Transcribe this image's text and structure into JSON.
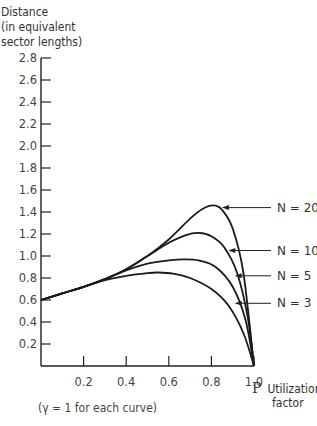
{
  "chart_data": {
    "type": "line",
    "title": "",
    "ylabel_lines": [
      "Distance",
      "(in equivalent",
      "sector lengths)"
    ],
    "xlabel_symbol": "P",
    "xlabel_lines": [
      "Utilization",
      "factor"
    ],
    "note": "(γ = 1 for each curve)",
    "xlim": [
      0,
      1.0
    ],
    "ylim": [
      0,
      2.8
    ],
    "x_ticks": [
      0.2,
      0.4,
      0.6,
      0.8,
      1.0
    ],
    "x_tick_labels": [
      "0.2",
      "0.4",
      "0.6",
      "0.8",
      "1.0"
    ],
    "y_ticks": [
      0.2,
      0.4,
      0.6,
      0.8,
      1.0,
      1.2,
      1.4,
      1.6,
      1.8,
      2.0,
      2.2,
      2.4,
      2.6,
      2.8
    ],
    "y_tick_labels": [
      "0.2",
      "0.4",
      "0.6",
      "0.8",
      "1.0",
      "1.2",
      "1.4",
      "1.6",
      "1.8",
      "2.0",
      "2.2",
      "2.4",
      "2.6",
      "2.8"
    ],
    "grid": false,
    "legend": "inline labels with arrows at right",
    "series": [
      {
        "name": "N = 20",
        "x": [
          0.0,
          0.1,
          0.2,
          0.3,
          0.4,
          0.5,
          0.6,
          0.7,
          0.76,
          0.81,
          0.85,
          0.9,
          0.95,
          1.0
        ],
        "y": [
          0.6,
          0.66,
          0.72,
          0.79,
          0.88,
          1.0,
          1.15,
          1.34,
          1.43,
          1.46,
          1.42,
          1.25,
          0.85,
          0.0
        ]
      },
      {
        "name": "N = 10",
        "x": [
          0.0,
          0.1,
          0.2,
          0.3,
          0.4,
          0.5,
          0.6,
          0.68,
          0.74,
          0.8,
          0.86,
          0.92,
          0.97,
          1.0
        ],
        "y": [
          0.6,
          0.66,
          0.72,
          0.79,
          0.88,
          1.0,
          1.12,
          1.19,
          1.21,
          1.18,
          1.08,
          0.85,
          0.45,
          0.0
        ]
      },
      {
        "name": "N = 5",
        "x": [
          0.0,
          0.1,
          0.2,
          0.3,
          0.4,
          0.5,
          0.6,
          0.67,
          0.74,
          0.82,
          0.9,
          0.96,
          1.0
        ],
        "y": [
          0.6,
          0.66,
          0.72,
          0.79,
          0.87,
          0.93,
          0.96,
          0.97,
          0.96,
          0.9,
          0.72,
          0.42,
          0.0
        ]
      },
      {
        "name": "N = 3",
        "x": [
          0.0,
          0.1,
          0.2,
          0.3,
          0.4,
          0.5,
          0.55,
          0.62,
          0.7,
          0.8,
          0.88,
          0.95,
          1.0
        ],
        "y": [
          0.6,
          0.66,
          0.72,
          0.78,
          0.82,
          0.845,
          0.85,
          0.84,
          0.8,
          0.7,
          0.55,
          0.3,
          0.0
        ]
      }
    ],
    "annotations": [
      {
        "text": "N = 20",
        "arrow_to": [
          0.84,
          1.44
        ]
      },
      {
        "text": "N = 10",
        "arrow_to": [
          0.87,
          1.05
        ]
      },
      {
        "text": "N = 5",
        "arrow_to": [
          0.9,
          0.82
        ]
      },
      {
        "text": "N = 3",
        "arrow_to": [
          0.9,
          0.57
        ]
      }
    ]
  }
}
